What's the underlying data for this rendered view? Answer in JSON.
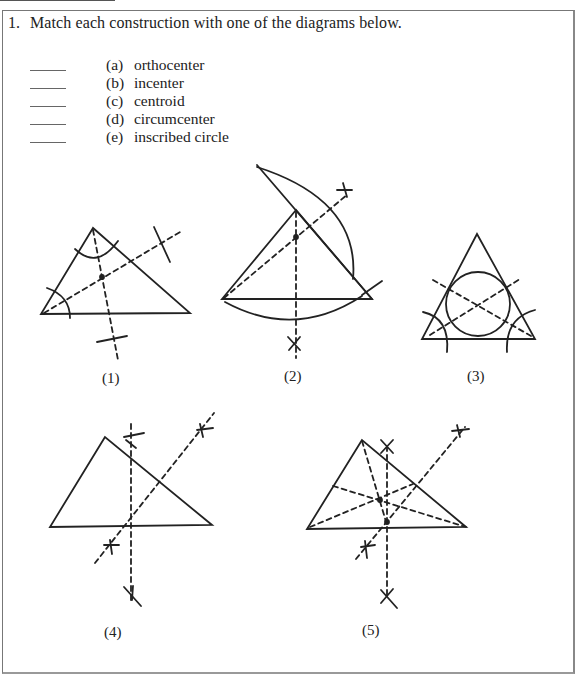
{
  "question": {
    "number": "1.",
    "text": "Match each construction with one of the diagrams below.",
    "items": [
      {
        "letter": "(a)",
        "label": "orthocenter",
        "answer": ""
      },
      {
        "letter": "(b)",
        "label": "incenter",
        "answer": ""
      },
      {
        "letter": "(c)",
        "label": "centroid",
        "answer": ""
      },
      {
        "letter": "(d)",
        "label": "circumcenter",
        "answer": ""
      },
      {
        "letter": "(e)",
        "label": "inscribed circle",
        "answer": ""
      }
    ]
  },
  "diagrams": [
    {
      "caption": "(1)",
      "depicts": "triangle with two angle bisector constructions (arcs and dashed bisectors)"
    },
    {
      "caption": "(2)",
      "depicts": "triangle with large arcs and dashed perpendicular constructions"
    },
    {
      "caption": "(3)",
      "depicts": "triangle with inscribed circle and dashed bisectors"
    },
    {
      "caption": "(4)",
      "depicts": "triangle with two dashed perpendicular bisectors"
    },
    {
      "caption": "(5)",
      "depicts": "triangle with perpendicular bisectors and dashed medians"
    }
  ]
}
